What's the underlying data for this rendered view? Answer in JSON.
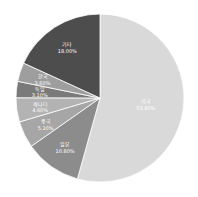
{
  "chart_data": {
    "type": "pie",
    "title": "",
    "start_angle_deg": 0,
    "direction": "clockwise",
    "slices": [
      {
        "label": "미국",
        "value": 53.8,
        "display": "53.80%",
        "color": "#d9d9d9"
      },
      {
        "label": "일본",
        "value": 10.8,
        "display": "10.80%",
        "color": "#8c8c8c"
      },
      {
        "label": "중국",
        "value": 5.1,
        "display": "5.10%",
        "color": "#a6a6a6"
      },
      {
        "label": "캐나다",
        "value": 4.6,
        "display": "4.60%",
        "color": "#b3b3b3"
      },
      {
        "label": "독일",
        "value": 3.1,
        "display": "3.10%",
        "color": "#7a7a7a"
      },
      {
        "label": "한국",
        "value": 3.6,
        "display": "3.60%",
        "color": "#9e9e9e"
      },
      {
        "label": "기타",
        "value": 18.0,
        "display": "18.00%",
        "color": "#4d4d4d"
      }
    ]
  }
}
